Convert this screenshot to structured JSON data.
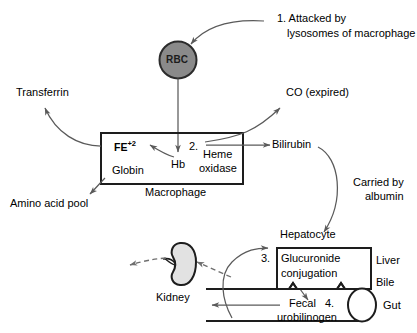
{
  "diagram": {
    "colors": {
      "stroke": "#2b2b2b",
      "arrow": "#5a5a5a",
      "rbc_fill": "#8a8a8a",
      "rbc_stroke": "#2b2b2b",
      "kidney_fill": "#e2e2e2",
      "kidney_stroke": "#1d1d1d",
      "text": "#000000",
      "background": "#ffffff"
    },
    "annotations": {
      "step1_line1": "1. Attacked by",
      "step1_line2": "lysosomes of macrophage",
      "rbc": "RBC",
      "transferrin": "Transferrin",
      "co_expired": "CO (expired)",
      "fe_base": "FE",
      "fe_sup": "+2",
      "step2": "2.",
      "hb": "Hb",
      "heme_line1": "Heme",
      "heme_line2": "oxidase",
      "globin": "Globin",
      "macrophage": "Macrophage",
      "amino_acid_pool": "Amino acid pool",
      "bilirubin": "Bilirubin",
      "carried_line1": "Carried by",
      "carried_line2": "albumin",
      "hepatocyte": "Hepatocyte",
      "step3": "3.",
      "glucuronide_line1": "Glucuronide",
      "glucuronide_line2": "conjugation",
      "liver": "Liver",
      "bile": "Bile",
      "kidney": "Kidney",
      "fecal": "Fecal",
      "urobilinogen": "urobilinogen",
      "step4": "4.",
      "gut": "Gut"
    }
  }
}
